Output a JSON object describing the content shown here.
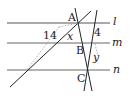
{
  "diagram": {
    "points": {
      "A": "A",
      "B": "B",
      "C": "C"
    },
    "lines": {
      "l": "l",
      "m": "m",
      "n": "n"
    },
    "values": {
      "left": "14",
      "right": "4"
    },
    "variables": {
      "x": "x",
      "y": "y"
    },
    "colors": {
      "line": "#222222",
      "parallel": "#555555",
      "dotted": "#999999"
    }
  }
}
